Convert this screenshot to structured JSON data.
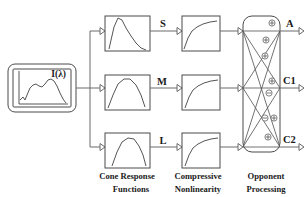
{
  "figure": {
    "background_color": "#ffffff",
    "line_color": "#5a5a5a",
    "text_color": "#1a1a1a"
  },
  "input": {
    "label": "I(λ)",
    "name": "spectral-power-distribution",
    "curve_description": "irregular spectral power distribution curve"
  },
  "cone_stage": {
    "caption_line1": "Cone Response",
    "caption_line2": "Functions",
    "channels": [
      {
        "signal": "S",
        "curve": "short-wavelength-sensitivity",
        "peak_position": "left"
      },
      {
        "signal": "M",
        "curve": "medium-wavelength-sensitivity",
        "peak_position": "center"
      },
      {
        "signal": "L",
        "curve": "long-wavelength-sensitivity",
        "peak_position": "center-right"
      }
    ]
  },
  "nonlinearity_stage": {
    "caption_line1": "Compressive",
    "caption_line2": "Nonlinearity",
    "curve_description": "saturating compressive response curve",
    "count": 3
  },
  "opponent_stage": {
    "caption_line1": "Opponent",
    "caption_line2": "Processing",
    "outputs": [
      {
        "label": "A",
        "name": "achromatic-output"
      },
      {
        "label": "C1",
        "name": "chromatic-output-1"
      },
      {
        "label": "C2",
        "name": "chromatic-output-2"
      }
    ],
    "signs": [
      {
        "sign": "+",
        "output": "A"
      },
      {
        "sign": "+",
        "output": "A"
      },
      {
        "sign": "+",
        "output": "A"
      },
      {
        "sign": "+",
        "output": "C1"
      },
      {
        "sign": "-",
        "output": "C1"
      },
      {
        "sign": "-",
        "output": "C2"
      },
      {
        "sign": "+",
        "output": "C2"
      },
      {
        "sign": "+",
        "output": "C2"
      }
    ]
  }
}
